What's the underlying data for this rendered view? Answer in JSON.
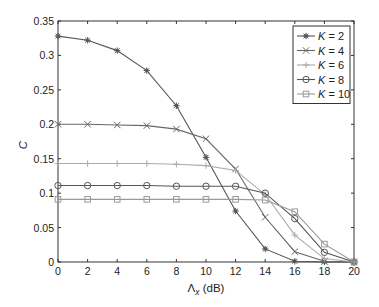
{
  "chart_data": {
    "type": "line",
    "title": "",
    "xlabel": "Λ_x (dB)",
    "xlabel_main": "Λ",
    "xlabel_sub": "x",
    "xlabel_unit": " (dB)",
    "ylabel": "C",
    "xlim": [
      0,
      20
    ],
    "ylim": [
      0,
      0.35
    ],
    "xticks": [
      0,
      2,
      4,
      6,
      8,
      10,
      12,
      14,
      16,
      18,
      20
    ],
    "xtick_labels": [
      "0",
      "2",
      "4",
      "6",
      "8",
      "10",
      "12",
      "14",
      "16",
      "18",
      "20"
    ],
    "yticks": [
      0,
      0.05,
      0.1,
      0.15,
      0.2,
      0.25,
      0.3,
      0.35
    ],
    "ytick_labels": [
      "0",
      "0.05",
      "0.1",
      "0.15",
      "0.2",
      "0.25",
      "0.3",
      "0.35"
    ],
    "grid": false,
    "legend_position": "top-right",
    "x": [
      0,
      2,
      4,
      6,
      8,
      10,
      12,
      14,
      16,
      18,
      20
    ],
    "series": [
      {
        "name": "K = 2",
        "k_label": "K",
        "k_value": "2",
        "marker": "star",
        "color": "#555555",
        "values": [
          0.328,
          0.322,
          0.307,
          0.278,
          0.227,
          0.152,
          0.074,
          0.019,
          0.001,
          0.0,
          0.0
        ]
      },
      {
        "name": "K = 4",
        "k_label": "K",
        "k_value": "4",
        "marker": "cross",
        "color": "#666666",
        "values": [
          0.2,
          0.2,
          0.199,
          0.198,
          0.193,
          0.179,
          0.135,
          0.065,
          0.015,
          0.001,
          0.0
        ]
      },
      {
        "name": "K = 6",
        "k_label": "K",
        "k_value": "6",
        "marker": "plus",
        "color": "#aaaaaa",
        "values": [
          0.143,
          0.143,
          0.143,
          0.143,
          0.142,
          0.14,
          0.133,
          0.098,
          0.039,
          0.005,
          0.0
        ]
      },
      {
        "name": "K = 8",
        "k_label": "K",
        "k_value": "8",
        "marker": "circle",
        "color": "#555555",
        "values": [
          0.111,
          0.111,
          0.111,
          0.111,
          0.11,
          0.11,
          0.11,
          0.1,
          0.063,
          0.014,
          0.0
        ]
      },
      {
        "name": "K = 10",
        "k_label": "K",
        "k_value": "10",
        "marker": "square",
        "color": "#999999",
        "values": [
          0.091,
          0.091,
          0.091,
          0.091,
          0.091,
          0.091,
          0.091,
          0.09,
          0.073,
          0.026,
          0.0
        ]
      }
    ]
  }
}
